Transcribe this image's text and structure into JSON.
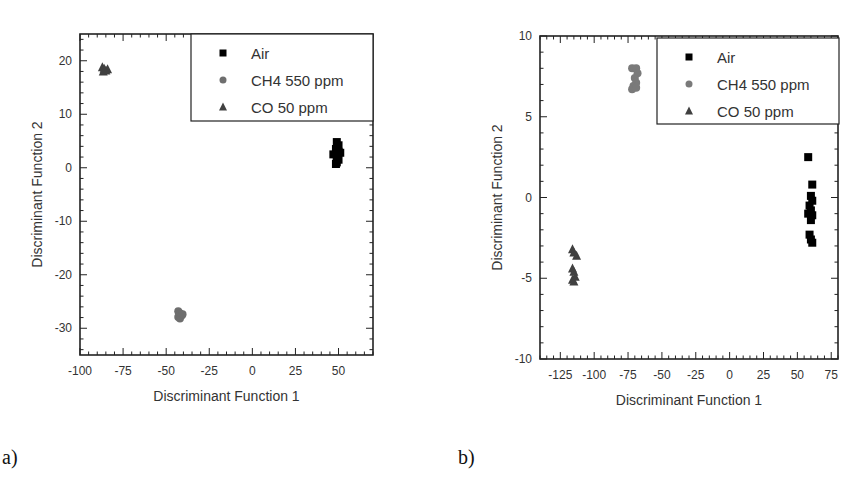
{
  "chart_data": [
    {
      "panel_label": "a)",
      "type": "scatter",
      "title": "",
      "xlabel": "Discriminant Function 1",
      "ylabel": "Discriminant Function 2",
      "xlim": [
        -100,
        70
      ],
      "ylim": [
        -35,
        25
      ],
      "xticks": [
        -100,
        -75,
        -50,
        -25,
        0,
        25,
        50
      ],
      "yticks": [
        -30,
        -20,
        -10,
        0,
        10,
        20
      ],
      "grid": false,
      "legend_position": "upper right",
      "series": [
        {
          "name": "Air",
          "marker": "square",
          "color": "#000000",
          "points": [
            [
              49,
              4.8
            ],
            [
              50,
              4.2
            ],
            [
              48.5,
              3.5
            ],
            [
              50,
              3.0
            ],
            [
              47,
              2.5
            ],
            [
              51,
              2.8
            ],
            [
              49,
              2.0
            ],
            [
              50,
              1.5
            ],
            [
              49,
              1.0
            ],
            [
              48.5,
              0.7
            ]
          ]
        },
        {
          "name": "CH4  550 ppm",
          "marker": "circle",
          "color": "#6e6e6e",
          "points": [
            [
              -43,
              -26.8
            ],
            [
              -42,
              -27.2
            ],
            [
              -41,
              -27.6
            ],
            [
              -43,
              -27.9
            ],
            [
              -42,
              -28.2
            ],
            [
              -40.5,
              -27.4
            ]
          ]
        },
        {
          "name": "CO 50 ppm",
          "marker": "triangle",
          "color": "#404040",
          "points": [
            [
              -87,
              18.8
            ],
            [
              -86,
              18.5
            ],
            [
              -85,
              18.2
            ],
            [
              -84,
              18.4
            ],
            [
              -86.5,
              18.0
            ]
          ]
        }
      ]
    },
    {
      "panel_label": "b)",
      "type": "scatter",
      "title": "",
      "xlabel": "Discriminant Function 1",
      "ylabel": "Discriminant Function 2",
      "xlim": [
        -140,
        80
      ],
      "ylim": [
        -10,
        10
      ],
      "xticks": [
        -125,
        -100,
        -75,
        -50,
        -25,
        0,
        25,
        50,
        75
      ],
      "yticks": [
        -10,
        -5,
        0,
        5,
        10
      ],
      "grid": false,
      "legend_position": "upper right",
      "series": [
        {
          "name": "Air",
          "marker": "square",
          "color": "#000000",
          "points": [
            [
              58,
              2.5
            ],
            [
              61,
              0.8
            ],
            [
              60,
              0.1
            ],
            [
              61,
              -0.2
            ],
            [
              59,
              -0.5
            ],
            [
              60,
              -0.8
            ],
            [
              58,
              -1.0
            ],
            [
              61,
              -1.1
            ],
            [
              60,
              -1.4
            ],
            [
              59,
              -2.3
            ],
            [
              60,
              -2.6
            ],
            [
              61,
              -2.8
            ]
          ]
        },
        {
          "name": "CH4  550 ppm",
          "marker": "circle",
          "color": "#7a7a7a",
          "points": [
            [
              -72,
              8.0
            ],
            [
              -69,
              8.0
            ],
            [
              -68,
              7.7
            ],
            [
              -70,
              7.4
            ],
            [
              -69,
              7.1
            ],
            [
              -71,
              6.9
            ],
            [
              -72,
              6.7
            ],
            [
              -69,
              6.8
            ]
          ]
        },
        {
          "name": "CO 50 ppm",
          "marker": "triangle",
          "color": "#404040",
          "points": [
            [
              -116,
              -3.2
            ],
            [
              -115,
              -3.4
            ],
            [
              -113,
              -3.6
            ],
            [
              -116,
              -4.4
            ],
            [
              -115,
              -4.6
            ],
            [
              -114,
              -4.9
            ],
            [
              -116,
              -5.1
            ],
            [
              -115,
              -5.2
            ]
          ]
        }
      ]
    }
  ],
  "captions": {
    "a": "a)",
    "b": "b)"
  }
}
